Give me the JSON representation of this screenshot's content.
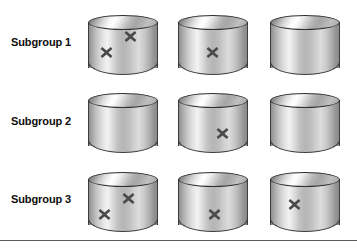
{
  "figure": {
    "background_color": "#ffffff",
    "width": 357,
    "height": 251,
    "mark_color": "#4a4a4a",
    "cylinder_outline_color": "#3c3c3c",
    "rule_color": "#5a5a5a",
    "mark_glyph": "x-mark-icon"
  },
  "rows": [
    {
      "label": "Subgroup 1",
      "label_top": 36,
      "cylinders": [
        {
          "left": 88,
          "top": 15,
          "marks": [
            {
              "left": 36,
              "top": 15
            },
            {
              "left": 12,
              "top": 31
            }
          ]
        },
        {
          "left": 178,
          "top": 15,
          "marks": [
            {
              "left": 28,
              "top": 31
            }
          ]
        },
        {
          "left": 270,
          "top": 15,
          "marks": []
        }
      ]
    },
    {
      "label": "Subgroup 2",
      "label_top": 115,
      "cylinders": [
        {
          "left": 88,
          "top": 93,
          "marks": []
        },
        {
          "left": 178,
          "top": 93,
          "marks": [
            {
              "left": 38,
              "top": 34
            }
          ]
        },
        {
          "left": 270,
          "top": 93,
          "marks": []
        }
      ]
    },
    {
      "label": "Subgroup 3",
      "label_top": 193,
      "cylinders": [
        {
          "left": 88,
          "top": 172,
          "marks": [
            {
              "left": 34,
              "top": 20
            },
            {
              "left": 10,
              "top": 36
            }
          ]
        },
        {
          "left": 178,
          "top": 172,
          "marks": [
            {
              "left": 30,
              "top": 36
            }
          ]
        },
        {
          "left": 270,
          "top": 172,
          "marks": [
            {
              "left": 18,
              "top": 26
            }
          ]
        }
      ]
    }
  ],
  "bottom_rule": {
    "top": 240
  }
}
